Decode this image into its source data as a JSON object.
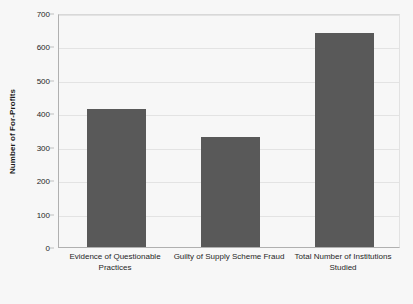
{
  "chart_data": {
    "type": "bar",
    "title": "",
    "subtitle": "",
    "xlabel": "",
    "ylabel": "Number of For-Profits",
    "categories": [
      "Evidence of Questionable Practices",
      "Guilty of Supply Scheme Fraud",
      "Total Number of Institutions Studied"
    ],
    "values": [
      413,
      330,
      640
    ],
    "series": [
      {
        "name": "Number of For-Profits",
        "values": [
          413,
          330,
          640
        ]
      }
    ],
    "ylim": [
      0,
      700
    ],
    "ytick_labels": [
      "0",
      "100",
      "200",
      "300",
      "400",
      "500",
      "600",
      "700"
    ],
    "ytick_values": [
      0,
      100,
      200,
      300,
      400,
      500,
      600,
      700
    ],
    "grid": true,
    "legend": false,
    "legend_position": "none",
    "bar_color": "#595959",
    "gridline_color": "#e3e3e3",
    "axis_color": "#b0b0b0",
    "background_color": "#f7f7f7",
    "text_color": "#262626"
  },
  "axes": {
    "y_title": "Number of For-Profits"
  }
}
